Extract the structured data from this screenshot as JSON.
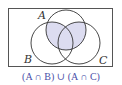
{
  "diagram": {
    "type": "venn",
    "sets": [
      {
        "label": "A",
        "cx": 66,
        "cy": 30,
        "r": 20
      },
      {
        "label": "B",
        "cx": 52,
        "cy": 43,
        "r": 21
      },
      {
        "label": "C",
        "cx": 79,
        "cy": 43,
        "r": 21
      }
    ],
    "universe": {
      "x": 8.5,
      "y": 8.5,
      "width": 104,
      "height": 58
    },
    "shaded_region": "(A ∩ B) ∪ (A ∩ C)",
    "shade_color": "#dcdcf0",
    "stroke_color": "#333333",
    "caption": "(A ∩ B) ∪ (A ∩ C)",
    "caption_color": "#4a4fa8",
    "labels": {
      "A": "A",
      "B": "B",
      "C": "C"
    }
  }
}
